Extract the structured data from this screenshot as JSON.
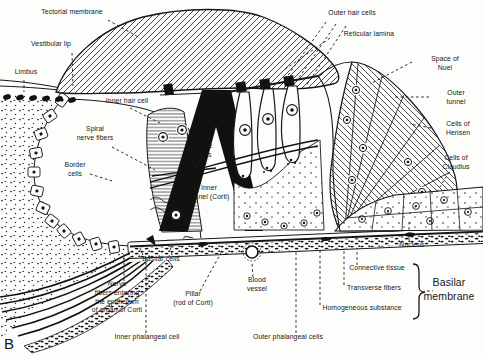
{
  "figure": {
    "panel_letter": "B",
    "ink_color": "#161616",
    "background_color": "#fdfdfc",
    "labels": {
      "tectorial_membrane": "Tectorial membrane",
      "vestibular_lip": "Vestibular lip",
      "limbus": "Limbus",
      "inner_hair_cell": "Inner hair cell",
      "spiral_nerve_fibers": "Spiral\nnerve fibers",
      "border_cells": "Border\ncells",
      "nerve_fibers": "Nerve\nfibers",
      "inner_tunnel": "Inner\ntunnel (Corti)",
      "outer_hair_cells": "Outer hair cells",
      "reticular_lamina": "Reticular lamina",
      "space_of_nuel": "Space of Nuel",
      "outer_tunnel": "Outer tunnel",
      "cells_of_hensen": "Cells of\nHensen",
      "cells_of_claudius": "Cells of\nClaudius",
      "nucleus": "Nucleus",
      "connective_tissue": "Connective tissue",
      "transverse_fibers": "Transverse fibers",
      "homogeneous_substance": "Homogeneous substance",
      "basilar_membrane": "Basilar\nmembrane",
      "blood_vessel": "Blood\nvessel",
      "basilar_cells": "Basilar cells",
      "nerve_fibers_entering": "Nerve\nfibers entering\nthe epithelium\nof organ of Corti",
      "pillar_rod_of_corti": "Pillar\n(rod of Corti)",
      "inner_phalangeal_cell": "Inner phalangeal cell",
      "outer_phalangeal_cells": "Outer phalangeal cells"
    }
  }
}
